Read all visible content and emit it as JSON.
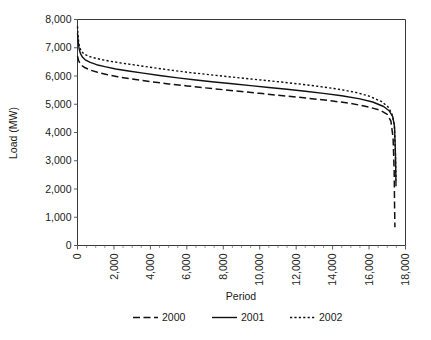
{
  "chart_data": {
    "type": "line",
    "title": "",
    "xlabel": "Period",
    "ylabel": "Load (MW)",
    "xlim": [
      0,
      18000
    ],
    "ylim": [
      0,
      8000
    ],
    "grid": false,
    "legend_position": "bottom",
    "x_ticks": [
      "0",
      "2,000",
      "4,000",
      "6,000",
      "8,000",
      "10,000",
      "12,000",
      "14,000",
      "16,000",
      "18,000"
    ],
    "x_tick_values": [
      0,
      2000,
      4000,
      6000,
      8000,
      10000,
      12000,
      14000,
      16000,
      18000
    ],
    "y_ticks": [
      "0",
      "1,000",
      "2,000",
      "3,000",
      "4,000",
      "5,000",
      "6,000",
      "7,000",
      "8,000"
    ],
    "y_tick_values": [
      0,
      1000,
      2000,
      3000,
      4000,
      5000,
      6000,
      7000,
      8000
    ],
    "x_minor_tick_step": 500,
    "series": [
      {
        "name": "2000",
        "style": "dashed",
        "color": "#111111",
        "dash": "7,3.5",
        "width": 1.5,
        "x": [
          0,
          60,
          140,
          260,
          420,
          700,
          1100,
          1600,
          2200,
          3000,
          4000,
          5000,
          6000,
          7000,
          8000,
          9000,
          10000,
          11000,
          12000,
          13000,
          14000,
          15000,
          16000,
          16600,
          17000,
          17200,
          17320,
          17380,
          17400,
          17420
        ],
        "y": [
          6700,
          6550,
          6440,
          6360,
          6290,
          6210,
          6130,
          6050,
          5975,
          5890,
          5800,
          5720,
          5650,
          5580,
          5515,
          5450,
          5385,
          5320,
          5255,
          5190,
          5115,
          5030,
          4900,
          4790,
          4640,
          4400,
          3800,
          2600,
          1400,
          650
        ]
      },
      {
        "name": "2001",
        "style": "solid",
        "color": "#111111",
        "dash": "none",
        "width": 1.4,
        "x": [
          0,
          40,
          90,
          170,
          280,
          450,
          700,
          1050,
          1500,
          2100,
          2800,
          3600,
          4500,
          5500,
          6500,
          7500,
          8500,
          9500,
          10500,
          11500,
          12500,
          13500,
          14500,
          15500,
          16200,
          16800,
          17100,
          17300,
          17400,
          17450,
          17480
        ],
        "y": [
          7520,
          7200,
          6950,
          6780,
          6660,
          6560,
          6480,
          6400,
          6330,
          6250,
          6175,
          6100,
          6020,
          5935,
          5860,
          5790,
          5725,
          5660,
          5595,
          5530,
          5460,
          5385,
          5300,
          5190,
          5080,
          4920,
          4770,
          4560,
          4200,
          3200,
          2100
        ]
      },
      {
        "name": "2002",
        "style": "dotted",
        "color": "#111111",
        "dash": "2.2,2.2",
        "width": 1.4,
        "x": [
          0,
          30,
          70,
          130,
          220,
          360,
          560,
          850,
          1250,
          1800,
          2500,
          3300,
          4200,
          5200,
          6200,
          7200,
          8200,
          9200,
          10200,
          11200,
          12200,
          13200,
          14200,
          15200,
          16000,
          16700,
          17050,
          17250,
          17380,
          17440,
          17480
        ],
        "y": [
          7760,
          7430,
          7170,
          6990,
          6870,
          6780,
          6710,
          6650,
          6590,
          6520,
          6450,
          6375,
          6290,
          6200,
          6120,
          6050,
          5980,
          5915,
          5850,
          5785,
          5715,
          5635,
          5545,
          5430,
          5290,
          5090,
          4900,
          4670,
          4300,
          3400,
          2300
        ]
      }
    ]
  },
  "legend": {
    "items": [
      {
        "label": "2000"
      },
      {
        "label": "2001"
      },
      {
        "label": "2002"
      }
    ]
  }
}
